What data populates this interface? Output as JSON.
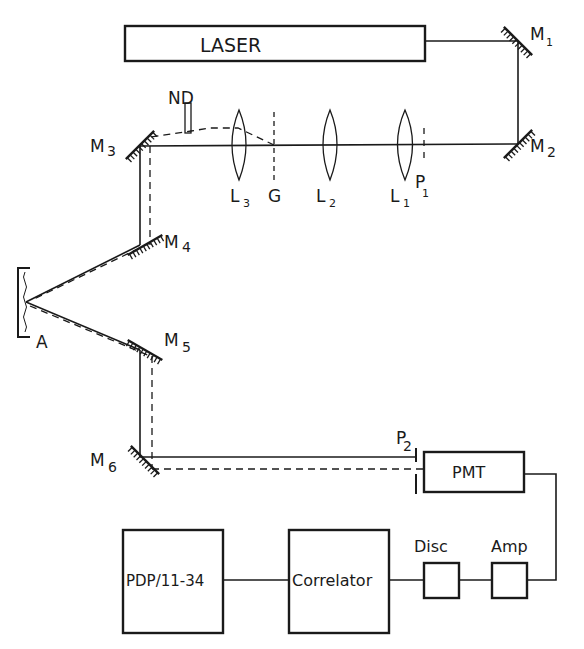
{
  "diagram": {
    "type": "optical-setup-schematic",
    "components": {
      "laser": "LASER",
      "mirrors": [
        {
          "id": "M",
          "sub": "1"
        },
        {
          "id": "M",
          "sub": "2"
        },
        {
          "id": "M",
          "sub": "3"
        },
        {
          "id": "M",
          "sub": "4"
        },
        {
          "id": "M",
          "sub": "5"
        },
        {
          "id": "M",
          "sub": "6"
        }
      ],
      "lenses": [
        {
          "id": "L",
          "sub": "1"
        },
        {
          "id": "L",
          "sub": "2"
        },
        {
          "id": "L",
          "sub": "3"
        }
      ],
      "pinholes": [
        {
          "id": "P",
          "sub": "1"
        },
        {
          "id": "P",
          "sub": "2"
        }
      ],
      "grating": "G",
      "nd_filter": "ND",
      "sample": "A",
      "detector": "PMT",
      "amplifier": "Amp",
      "discriminator": "Disc",
      "correlator": "Correlator",
      "computer": "PDP/11-34"
    }
  }
}
